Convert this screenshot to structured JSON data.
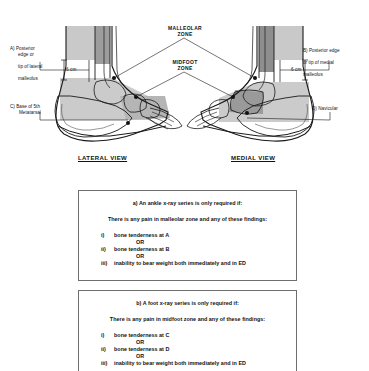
{
  "figure": {
    "zones": [
      {
        "id": "malleolar",
        "label": "MALLEOLAR\nZONE"
      },
      {
        "id": "midfoot",
        "label": "MIDFOOT\nZONE"
      }
    ],
    "views": [
      {
        "id": "lateral",
        "label": "LATERAL VIEW"
      },
      {
        "id": "medial",
        "label": "MEDIAL VIEW"
      }
    ],
    "measurements": [
      {
        "id": "left-6cm",
        "label": "6 cm"
      },
      {
        "id": "right-6cm",
        "label": "6 cm"
      }
    ],
    "callouts": [
      {
        "id": "a",
        "line1": "A) Posterior",
        "line2": "edge or",
        "line3": "tip of lateral",
        "line4": "malleolus"
      },
      {
        "id": "b",
        "line1": "B) Posterior edge",
        "line2": "or tip of medial",
        "line3": "malleolus"
      },
      {
        "id": "c",
        "line1": "C) Base of 5th",
        "line2": "Metatarsal"
      },
      {
        "id": "d",
        "line1": "D) Navicular"
      }
    ]
  },
  "rule_boxes": [
    {
      "id": "ankle",
      "heading": "a) An ankle x-ray series is only required if:",
      "subheading": "There is any pain in malleolar zone and any of these findings:",
      "or_label_1": "OR",
      "or_label_2": "OR",
      "items": [
        {
          "num": "i)",
          "text": "bone tenderness at A"
        },
        {
          "num": "ii)",
          "text": "bone tenderness at B"
        },
        {
          "num": "iii)",
          "text": "inability to bear weight both immediately and in ED"
        }
      ]
    },
    {
      "id": "foot",
      "heading": "b) A foot x-ray series is only required if:",
      "subheading": "There is any pain in midfoot zone and any of these findings:",
      "or_label_1": "OR",
      "or_label_2": "OR",
      "items": [
        {
          "num": "i)",
          "text": "bone tenderness at C"
        },
        {
          "num": "ii)",
          "text": "bone tenderness at D"
        },
        {
          "num": "iii)",
          "text": "inability to bear weight both immediately and in ED"
        }
      ]
    }
  ],
  "colors": {
    "shade_light": "#c9c9c9",
    "shade_mid": "#b0b0b0",
    "shade_dark": "#8a8a8a",
    "outline": "#1a1a1a",
    "box_border": "#6e6e6e",
    "text": "#111111"
  }
}
